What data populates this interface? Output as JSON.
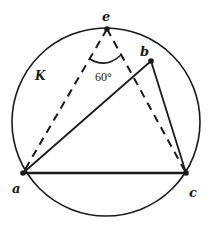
{
  "diagram": {
    "circle_label": "K",
    "points": {
      "a": "a",
      "b": "b",
      "c": "c",
      "e": "e"
    },
    "angle_label": "60°",
    "solid_segments": [
      "ab",
      "bc",
      "ac"
    ],
    "dashed_segments": [
      "ea",
      "ec"
    ],
    "colors": {
      "stroke": "#1a1a1a",
      "background": "#ffffff"
    }
  }
}
